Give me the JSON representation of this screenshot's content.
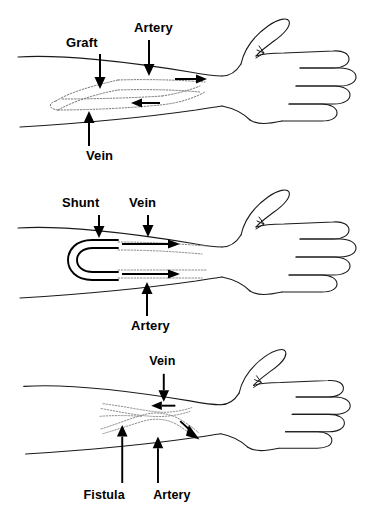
{
  "figure": {
    "panel_count": 3,
    "ink_color": "#000000",
    "background_color": "#ffffff",
    "vessel_color": "#6b6b6b"
  },
  "panels": [
    {
      "id": "graft",
      "name": "Graft access panel",
      "labels": [
        {
          "text": "Graft",
          "x": 66,
          "y": 47
        },
        {
          "text": "Artery",
          "x": 134,
          "y": 32
        },
        {
          "text": "Vein",
          "x": 86,
          "y": 160
        }
      ],
      "flow_arrows": [
        {
          "direction": "right",
          "meaning": "arterial inflow toward hand"
        },
        {
          "direction": "left",
          "meaning": "venous outflow away from hand"
        }
      ]
    },
    {
      "id": "shunt",
      "name": "Shunt access panel",
      "labels": [
        {
          "text": "Shunt",
          "x": 62,
          "y": 37
        },
        {
          "text": "Vein",
          "x": 129,
          "y": 37
        },
        {
          "text": "Artery",
          "x": 131,
          "y": 160
        }
      ],
      "flow_arrows": [
        {
          "direction": "right",
          "meaning": "venous limb flow"
        },
        {
          "direction": "right",
          "meaning": "arterial limb flow"
        }
      ]
    },
    {
      "id": "fistula",
      "name": "Fistula access panel",
      "labels": [
        {
          "text": "Vein",
          "x": 148,
          "y": 26
        },
        {
          "text": "Fistula",
          "x": 80,
          "y": 160
        },
        {
          "text": "Artery",
          "x": 152,
          "y": 160
        }
      ],
      "flow_arrows": [
        {
          "direction": "left",
          "meaning": "venous outflow"
        },
        {
          "direction": "down-right",
          "meaning": "arterial inflow"
        }
      ]
    }
  ],
  "caption": {
    "line": ""
  }
}
